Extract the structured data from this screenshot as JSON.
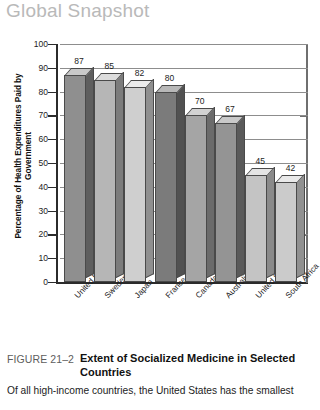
{
  "banner": {
    "label": "Global Snapshot"
  },
  "chart_data": {
    "type": "bar",
    "title": "",
    "xlabel": "",
    "ylabel": "Percentage of Health Expenditures Paid by Government",
    "ylim": [
      0,
      100
    ],
    "yticks": [
      0,
      10,
      20,
      30,
      40,
      50,
      60,
      70,
      80,
      90,
      100
    ],
    "grid": true,
    "legend": "none",
    "categories": [
      "United Kingdom",
      "Sweden",
      "Japan",
      "France",
      "Canada",
      "Australia",
      "United States",
      "South Africa"
    ],
    "values": [
      87,
      85,
      82,
      80,
      70,
      67,
      45,
      42
    ],
    "bar_styles": [
      {
        "front": "#8f8f8f",
        "top": "#c9c9c9",
        "side": "#5e5e5e"
      },
      {
        "front": "#b6b6b6",
        "top": "#dcdcdc",
        "side": "#7c7c7c"
      },
      {
        "front": "#cfcfcf",
        "top": "#ececec",
        "side": "#8f8f8f"
      },
      {
        "front": "#7b7b7b",
        "top": "#b8b8b8",
        "side": "#515151"
      },
      {
        "front": "#a5a5a5",
        "top": "#d2d2d2",
        "side": "#6b6b6b"
      },
      {
        "front": "#949494",
        "top": "#c9c9c9",
        "side": "#5a5a5a"
      },
      {
        "front": "#c4c4c4",
        "top": "#e4e4e4",
        "side": "#8a8a8a"
      },
      {
        "front": "#cbcbcb",
        "top": "#e9e9e9",
        "side": "#909090"
      }
    ]
  },
  "caption": {
    "figure_number": "FIGURE 21–2",
    "title": "Extent of Socialized Medicine in Selected Countries",
    "body": "Of all high-income countries, the United States has the smallest"
  }
}
